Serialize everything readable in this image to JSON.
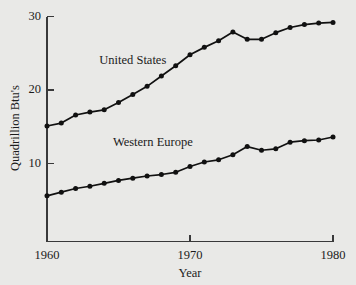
{
  "chart_data": {
    "type": "line",
    "title": "",
    "xlabel": "Year",
    "ylabel": "Quadrillion Btu's",
    "xlim": [
      1960,
      1980
    ],
    "ylim": [
      0,
      30
    ],
    "xticks": [
      1960,
      1970,
      1980
    ],
    "xtick_labels": [
      "1960",
      "1970",
      "1980"
    ],
    "yticks": [
      10,
      20,
      30
    ],
    "ytick_labels": [
      "10",
      "20",
      "30"
    ],
    "grid": false,
    "legend_position": "inline-annotations",
    "x": [
      1960,
      1961,
      1962,
      1963,
      1964,
      1965,
      1966,
      1967,
      1968,
      1969,
      1970,
      1971,
      1972,
      1973,
      1974,
      1975,
      1976,
      1977,
      1978,
      1979,
      1980
    ],
    "series": [
      {
        "name": "United States",
        "color": "#111111",
        "label_x": 1966.0,
        "label_y": 23.6,
        "values": [
          15.1,
          15.5,
          16.6,
          17.0,
          17.3,
          18.3,
          19.4,
          20.5,
          21.9,
          23.3,
          24.8,
          25.8,
          26.7,
          27.9,
          26.9,
          26.9,
          27.8,
          28.5,
          28.9,
          29.1,
          29.2
        ]
      },
      {
        "name": "Western Europe",
        "color": "#111111",
        "label_x": 1967.4,
        "label_y": 12.4,
        "values": [
          5.6,
          6.1,
          6.6,
          6.9,
          7.3,
          7.7,
          8.0,
          8.3,
          8.5,
          8.8,
          9.6,
          10.2,
          10.5,
          11.2,
          12.3,
          11.8,
          12.0,
          12.9,
          13.1,
          13.2,
          13.6
        ]
      }
    ]
  },
  "axes": {
    "y_axis_title": "Quadrillion Btu's",
    "x_axis_title": "Year",
    "x_tick_labels": [
      "1960",
      "1970",
      "1980"
    ],
    "y_tick_labels": [
      "10",
      "20",
      "30"
    ]
  },
  "annotations": {
    "united_states": "United States",
    "western_europe": "Western Europe"
  }
}
